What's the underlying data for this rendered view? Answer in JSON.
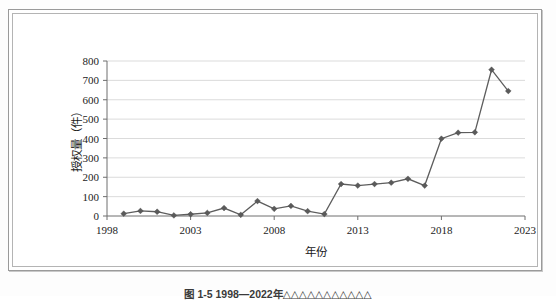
{
  "figure": {
    "caption": "图 1-5  1998—2022年△△△△△△△△△△△"
  },
  "chart_data": {
    "type": "line",
    "title": "",
    "xlabel": "年份",
    "ylabel": "授权量（件）",
    "xlim": [
      1998,
      2023
    ],
    "ylim": [
      0,
      800
    ],
    "ytick_step": 100,
    "xtick_step": 5,
    "grid": "horizontal",
    "legend": "none",
    "marker": "diamond",
    "line_color": "#5d5d5d",
    "marker_color": "#5a5a5a",
    "grid_color": "#d2d2d2",
    "axis_color": "#6e6e6e",
    "xticks": [
      1998,
      2003,
      2008,
      2013,
      2018,
      2023
    ],
    "yticks": [
      0,
      100,
      200,
      300,
      400,
      500,
      600,
      700,
      800
    ],
    "x": [
      1999,
      2000,
      2001,
      2002,
      2003,
      2004,
      2005,
      2006,
      2007,
      2008,
      2009,
      2010,
      2011,
      2012,
      2013,
      2014,
      2015,
      2016,
      2017,
      2018,
      2019,
      2020,
      2021,
      2022
    ],
    "values": [
      12,
      26,
      22,
      3,
      9,
      16,
      41,
      6,
      77,
      37,
      52,
      25,
      10,
      165,
      157,
      165,
      172,
      192,
      157,
      399,
      430,
      432,
      755,
      645
    ],
    "series": [
      {
        "name": "授权量",
        "values": [
          12,
          26,
          22,
          3,
          9,
          16,
          41,
          6,
          77,
          37,
          52,
          25,
          10,
          165,
          157,
          165,
          172,
          192,
          157,
          399,
          430,
          432,
          755,
          645
        ]
      }
    ]
  }
}
